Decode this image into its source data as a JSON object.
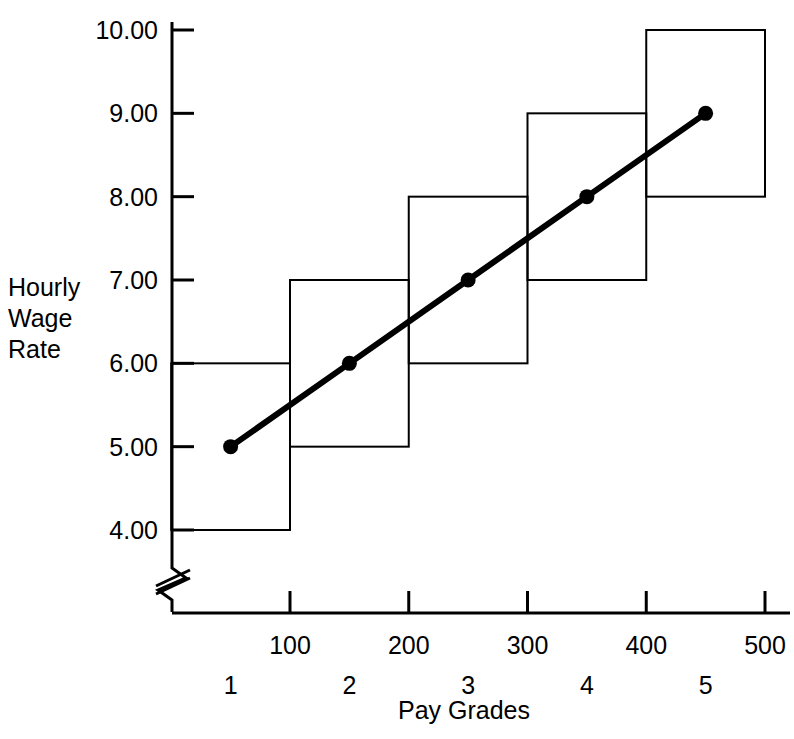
{
  "chart_data": {
    "type": "line",
    "title": "",
    "xlabel": "Pay Grades",
    "ylabel": "Hourly Wage Rate",
    "x": [
      50,
      150,
      250,
      350,
      450
    ],
    "values": [
      5.0,
      6.0,
      7.0,
      8.0,
      9.0
    ],
    "categories": [
      "1",
      "2",
      "3",
      "4",
      "5"
    ],
    "series": [
      {
        "name": "Wage line",
        "values": [
          5.0,
          6.0,
          7.0,
          8.0,
          9.0
        ]
      }
    ],
    "ranges": [
      {
        "grade": "1",
        "point_min": 0,
        "point_max": 100,
        "wage_min": 4.0,
        "wage_max": 6.0,
        "midpoint_wage": 5.0,
        "midpoint_point": 50
      },
      {
        "grade": "2",
        "point_min": 100,
        "point_max": 200,
        "wage_min": 5.0,
        "wage_max": 7.0,
        "midpoint_wage": 6.0,
        "midpoint_point": 150
      },
      {
        "grade": "3",
        "point_min": 200,
        "point_max": 300,
        "wage_min": 6.0,
        "wage_max": 8.0,
        "midpoint_wage": 7.0,
        "midpoint_point": 250
      },
      {
        "grade": "4",
        "point_min": 300,
        "point_max": 400,
        "wage_min": 7.0,
        "wage_max": 9.0,
        "midpoint_wage": 8.0,
        "midpoint_point": 350
      },
      {
        "grade": "5",
        "point_min": 400,
        "point_max": 500,
        "wage_min": 8.0,
        "wage_max": 10.0,
        "midpoint_wage": 9.0,
        "midpoint_point": 450
      }
    ],
    "ytick_labels": [
      "10.00",
      "9.00",
      "8.00",
      "7.00",
      "6.00",
      "5.00",
      "4.00"
    ],
    "ytick_values": [
      10.0,
      9.0,
      8.0,
      7.0,
      6.0,
      5.0,
      4.0
    ],
    "ylim": [
      4.0,
      10.0
    ],
    "xtick_labels": [
      "100",
      "200",
      "300",
      "400",
      "500"
    ],
    "xtick_values": [
      100,
      200,
      300,
      400,
      500
    ],
    "xlim": [
      0,
      530
    ],
    "grid": false,
    "legend": "none",
    "axis_break": "y-axis-break-below-4.00",
    "line_color": "#000000",
    "box_color": "#000000",
    "marker": "filled-circle"
  },
  "yaxis": {
    "title_lines": [
      "Hourly",
      "Wage",
      "Rate"
    ],
    "ticks": [
      {
        "label": "10.00"
      },
      {
        "label": "9.00"
      },
      {
        "label": "8.00"
      },
      {
        "label": "7.00"
      },
      {
        "label": "6.00"
      },
      {
        "label": "5.00"
      },
      {
        "label": "4.00"
      }
    ]
  },
  "xaxis": {
    "title": "Pay Grades",
    "point_ticks": [
      {
        "label": "100"
      },
      {
        "label": "200"
      },
      {
        "label": "300"
      },
      {
        "label": "400"
      },
      {
        "label": "500"
      }
    ],
    "grade_ticks": [
      {
        "label": "1"
      },
      {
        "label": "2"
      },
      {
        "label": "3"
      },
      {
        "label": "4"
      },
      {
        "label": "5"
      }
    ]
  }
}
